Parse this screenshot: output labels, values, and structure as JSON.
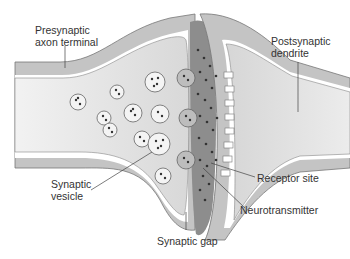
{
  "diagram": {
    "labels": {
      "presynaptic_line1": "Presynaptic",
      "presynaptic_line2": "axon terminal",
      "postsynaptic_line1": "Postsynaptic",
      "postsynaptic_line2": "dendrite",
      "vesicle_line1": "Synaptic",
      "vesicle_line2": "vesicle",
      "receptor": "Receptor site",
      "neurotransmitter": "Neurotransmitter",
      "gap": "Synaptic gap"
    },
    "colors": {
      "membrane_gray": "#b8b8b8",
      "cytoplasm_light": "#e6e6e6",
      "cleft_dark": "#8a8a8a",
      "dot": "#333333",
      "line": "#444444"
    }
  }
}
